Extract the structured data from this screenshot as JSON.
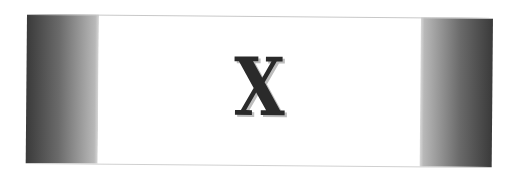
{
  "banner": {
    "glyph": "X",
    "colors": {
      "glyph": "#2a2a2a",
      "glyph_shadow": "#bdbdbd",
      "panel_dark": "#3a3a3a",
      "panel_light": "#d8d8d8",
      "center_background": "#ffffff"
    }
  }
}
